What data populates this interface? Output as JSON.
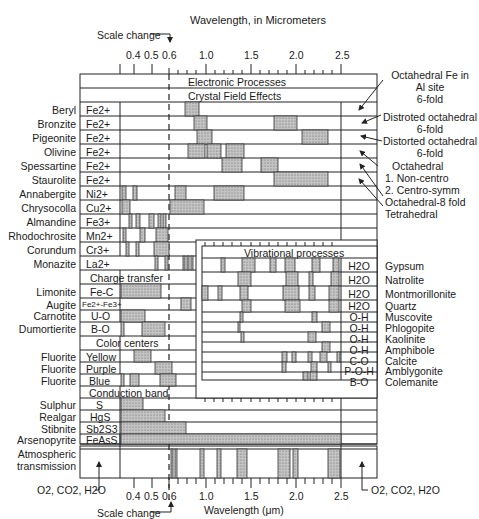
{
  "title": "Wavelength, in Micrometers",
  "bottom_axis_label": "Wavelength (μm)",
  "scale_change_label": "Scale change",
  "axis_ticks": [
    "0.4",
    "0.5",
    "0.6",
    "1.0",
    "1.5",
    "2.0",
    "2.5"
  ],
  "section_headers": {
    "electronic": "Electronic Processes",
    "crystal_field": "Crystal Field Effects",
    "charge_transfer": "Charge transfer",
    "color_centers": "Color centers",
    "conduction_band": "Conduction  band",
    "vibrational": "Vibrational processes"
  },
  "crystal_field_rows": [
    {
      "mineral": "Beryl",
      "ion": "Fe2+"
    },
    {
      "mineral": "Bronzite",
      "ion": "Fe2+"
    },
    {
      "mineral": "Pigeonite",
      "ion": "Fe2+"
    },
    {
      "mineral": "Olivine",
      "ion": "Fe2+"
    },
    {
      "mineral": "Spessartine",
      "ion": "Fe2+"
    },
    {
      "mineral": "Staurolite",
      "ion": "Fe2+"
    },
    {
      "mineral": "Annabergite",
      "ion": "Ni2+"
    },
    {
      "mineral": "Chrysocolla",
      "ion": "Cu2+"
    },
    {
      "mineral": "Almandine",
      "ion": "Fe3+"
    },
    {
      "mineral": "Rhodochrosite",
      "ion": "Mn2+"
    },
    {
      "mineral": "Corundum",
      "ion": "Cr3+"
    },
    {
      "mineral": "Monazite",
      "ion": "La2+"
    }
  ],
  "charge_transfer_rows": [
    {
      "mineral": "Limonite",
      "ion": "Fe-C"
    },
    {
      "mineral": "Augite",
      "ion": "Fe2+-Fe3+"
    },
    {
      "mineral": "Carnotite",
      "ion": "U-O"
    },
    {
      "mineral": "Dumortierite",
      "ion": "B-O"
    }
  ],
  "color_center_rows": [
    {
      "mineral": "Fluorite",
      "ion": "Yellow"
    },
    {
      "mineral": "Fluorite",
      "ion": "Purple"
    },
    {
      "mineral": "Fluorite",
      "ion": "Blue"
    }
  ],
  "conduction_rows": [
    {
      "mineral": "Sulphur",
      "ion": "S"
    },
    {
      "mineral": "Realgar",
      "ion": "HgS"
    },
    {
      "mineral": "Stibnite",
      "ion": "Sb2S3"
    },
    {
      "mineral": "Arsenopyrite",
      "ion": "FeAsS"
    }
  ],
  "atmospheric": {
    "label_line1": "Atmospheric",
    "label_line2": "transmission",
    "gases_label": "O2, CO2, H2O"
  },
  "vibrational_rows": [
    {
      "group": "H2O",
      "mineral": "Gypsum"
    },
    {
      "group": "H2O",
      "mineral": "Natrolite"
    },
    {
      "group": "H2O",
      "mineral": "Montmorillonite"
    },
    {
      "group": "H2O",
      "mineral": "Quartz"
    },
    {
      "group": "O-H",
      "mineral": "Muscovite"
    },
    {
      "group": "O-H",
      "mineral": "Phlogopite"
    },
    {
      "group": "O-H",
      "mineral": "Kaolinite"
    },
    {
      "group": "O-H",
      "mineral": "Amphibole"
    },
    {
      "group": "C-O",
      "mineral": "Calcite"
    },
    {
      "group": "P-O-H",
      "mineral": "Amblygonite"
    },
    {
      "group": "B-O",
      "mineral": "Colemanite"
    }
  ],
  "annotations": [
    {
      "line1": "Octahedral Fe in",
      "line2": "Al site",
      "line3": "6-fold"
    },
    {
      "line1": "Distroted octahedral",
      "line2": "6-fold"
    },
    {
      "line1": "Distorted octahedral",
      "line2": "6-fold"
    },
    {
      "line1": "Octahedral",
      "line2": "1. Non-centro",
      "line3": "2. Centro-symm"
    },
    {
      "line1": "Octahedral-8 fold"
    },
    {
      "line1": "Tetrahedral"
    }
  ]
}
